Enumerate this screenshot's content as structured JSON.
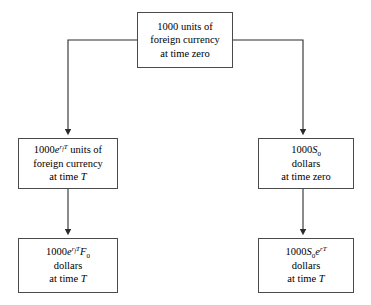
{
  "diagram": {
    "background_color": "#ffffff",
    "line_color": "#2b2b2b",
    "box_border_color": "#4a4a4a",
    "text_color": "#000000",
    "boxes": {
      "top": {
        "name": "initial-foreign-currency",
        "line1_amount": "1000",
        "line1_rest": " units of",
        "line2": "foreign currency",
        "line3": "at time zero"
      },
      "mid_left": {
        "name": "grown-foreign-currency",
        "prefix": "1000",
        "exp_base": "e",
        "exp_rate": "r",
        "exp_rate_sub": "f",
        "exp_time": "T",
        "suffix": " units of",
        "line2": "foreign currency",
        "line3_prefix": "at time ",
        "line3_var": "T"
      },
      "mid_right": {
        "name": "initial-dollars",
        "prefix": "1000",
        "spot_symbol": "S",
        "spot_sub": "0",
        "line2": "dollars",
        "line3": "at time zero"
      },
      "bottom_left": {
        "name": "forward-contract-dollars",
        "prefix": "1000",
        "exp_base": "e",
        "exp_rate": "r",
        "exp_rate_sub": "f",
        "exp_time": "T",
        "forward_symbol": "F",
        "forward_sub": "0",
        "line2": "dollars",
        "line3_prefix": "at time ",
        "line3_var": "T"
      },
      "bottom_right": {
        "name": "grown-dollars",
        "prefix": "1000",
        "spot_symbol": "S",
        "spot_sub": "0",
        "exp_base": "e",
        "exp_rate": "r",
        "exp_time": "T",
        "line2": "dollars",
        "line3_prefix": "at time ",
        "line3_var": "T"
      }
    },
    "connectors": [
      {
        "name": "top-to-mid-left",
        "type": "elbow-down-left",
        "from": "top",
        "to": "mid_left"
      },
      {
        "name": "top-to-mid-right",
        "type": "elbow-down-right",
        "from": "top",
        "to": "mid_right"
      },
      {
        "name": "mid-left-to-bottom-left",
        "type": "vertical",
        "from": "mid_left",
        "to": "bottom_left"
      },
      {
        "name": "mid-right-to-bottom-right",
        "type": "vertical",
        "from": "mid_right",
        "to": "bottom_right"
      }
    ]
  }
}
